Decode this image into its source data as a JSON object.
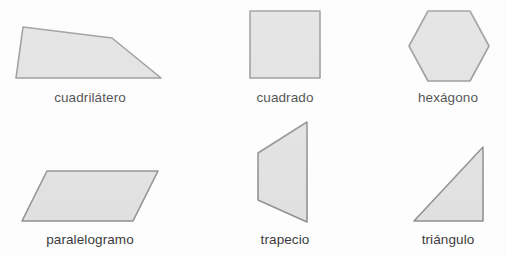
{
  "page": {
    "background_color": "#ffffff",
    "width": 506,
    "height": 256
  },
  "style": {
    "shape_fill": "#dcdcdc",
    "shape_stroke": "#7f7f7f",
    "stroke_width": 1.6,
    "label_color": "#1b1b1b"
  },
  "shapes": [
    {
      "id": "cuadrilatero",
      "label": "cuadrilátero",
      "type": "quadrilateral",
      "points": "23,27 112,38 161,78 16,78"
    },
    {
      "id": "cuadrado",
      "label": "cuadrado",
      "type": "square",
      "points": "250,11 320,11 320,78 250,78"
    },
    {
      "id": "hexagono",
      "label": "hexágono",
      "type": "hexagon",
      "points": "428,11 470,11 489,46 470,81 428,81 409,46"
    },
    {
      "id": "paralelogramo",
      "label": "paralelogramo",
      "type": "parallelogram",
      "points": "47,171 158,171 133,221 22,221"
    },
    {
      "id": "trapecio",
      "label": "trapecio",
      "type": "trapezoid",
      "points": "307,122 307,222 258,200 258,153"
    },
    {
      "id": "triangulo",
      "label": "triángulo",
      "type": "right-triangle",
      "points": "483,147 483,221 414,221"
    }
  ]
}
